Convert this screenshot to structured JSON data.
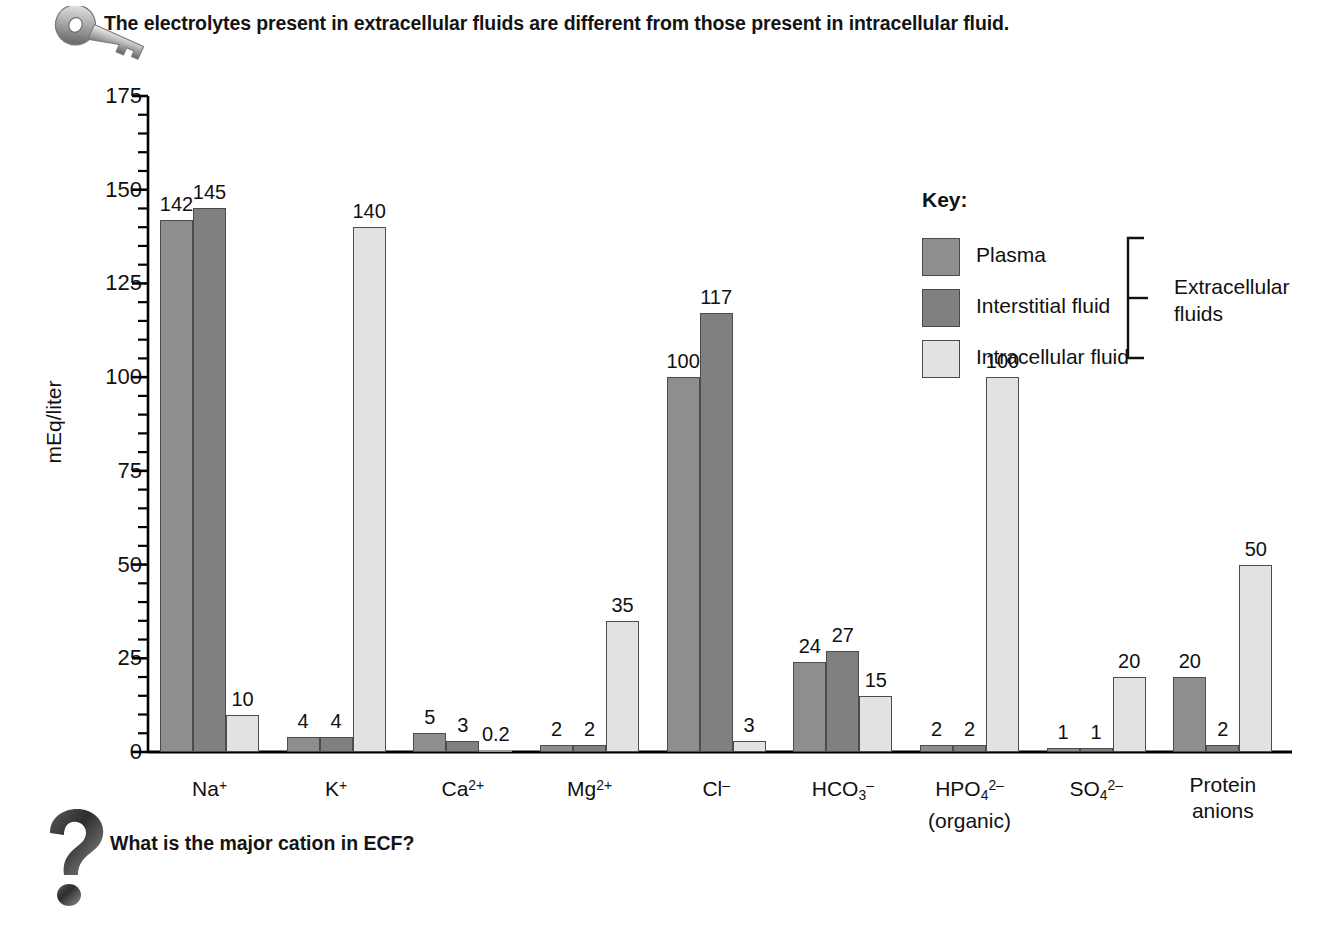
{
  "header": {
    "title": "The electrolytes present in extracellular fluids are different from those present in intracellular fluid.",
    "icon": "key-icon"
  },
  "footer": {
    "question": "What is the major cation in ECF?",
    "icon": "question-mark-icon"
  },
  "legend": {
    "title": "Key:",
    "bracket_label": "Extracellular fluids",
    "bracket_label_line1": "Extracellular",
    "bracket_label_line2": "fluids",
    "items": [
      {
        "label": "Plasma",
        "color": "#8e8e8e"
      },
      {
        "label": "Interstitial fluid",
        "color": "#808080"
      },
      {
        "label": "Intracellular fluid",
        "color": "#e2e2e2"
      }
    ]
  },
  "axis": {
    "y_title": "mEq/liter",
    "y_ticks": [
      "0",
      "25",
      "50",
      "75",
      "100",
      "125",
      "150",
      "175"
    ],
    "y_min": 0,
    "y_max": 175,
    "y_major_step": 25,
    "y_minor_step": 5
  },
  "colors": {
    "plasma": "#8e8e8e",
    "interstitial": "#808080",
    "intracellular": "#e2e2e2",
    "bar_outline": "#4c4c4c",
    "axis": "#000000",
    "text": "#111111"
  },
  "chart_data": {
    "type": "bar",
    "title": "The electrolytes present in extracellular fluids are different from those present in intracellular fluid.",
    "xlabel": "",
    "ylabel": "mEq/liter",
    "ylim": [
      0,
      175
    ],
    "grid": false,
    "legend_position": "top-right",
    "categories": [
      "Na+",
      "K+",
      "Ca2+",
      "Mg2+",
      "Cl-",
      "HCO3-",
      "HPO4 2- (organic)",
      "SO4 2-",
      "Protein anions"
    ],
    "category_labels": [
      {
        "base": "Na",
        "sup": "+",
        "sub": "",
        "line2": ""
      },
      {
        "base": "K",
        "sup": "+",
        "sub": "",
        "line2": ""
      },
      {
        "base": "Ca",
        "sup": "2+",
        "sub": "",
        "line2": ""
      },
      {
        "base": "Mg",
        "sup": "2+",
        "sub": "",
        "line2": ""
      },
      {
        "base": "Cl",
        "sup": "–",
        "sub": "",
        "line2": ""
      },
      {
        "base": "HCO",
        "sub": "3",
        "sup": "–",
        "line2": ""
      },
      {
        "base": "HPO",
        "sub": "4",
        "sup": "2–",
        "line2": "(organic)"
      },
      {
        "base": "SO",
        "sub": "4",
        "sup": "2–",
        "line2": ""
      },
      {
        "base": "Protein",
        "sub": "",
        "sup": "",
        "line2": "anions"
      }
    ],
    "series": [
      {
        "name": "Plasma",
        "color": "#8e8e8e",
        "values": [
          142,
          4,
          5,
          2,
          100,
          24,
          2,
          1,
          20
        ],
        "labels": [
          "142",
          "4",
          "5",
          "2",
          "100",
          "24",
          "2",
          "1",
          "20"
        ]
      },
      {
        "name": "Interstitial fluid",
        "color": "#808080",
        "values": [
          145,
          4,
          3,
          2,
          117,
          27,
          2,
          1,
          2
        ],
        "labels": [
          "145",
          "4",
          "3",
          "2",
          "117",
          "27",
          "2",
          "1",
          "2"
        ]
      },
      {
        "name": "Intracellular fluid",
        "color": "#e2e2e2",
        "values": [
          10,
          140,
          0.2,
          35,
          3,
          15,
          100,
          20,
          50
        ],
        "labels": [
          "10",
          "140",
          "0.2",
          "35",
          "3",
          "15",
          "100",
          "20",
          "50"
        ]
      }
    ]
  }
}
